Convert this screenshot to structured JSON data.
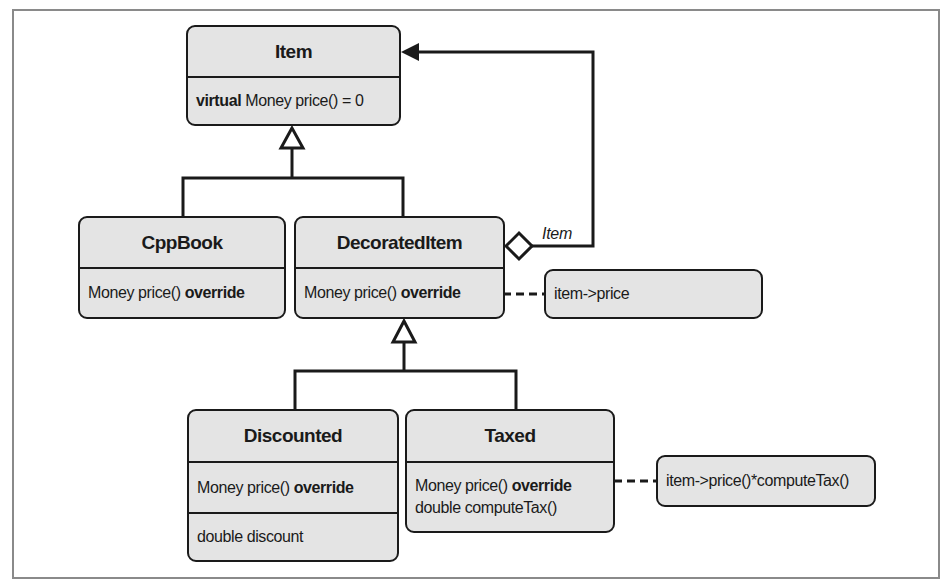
{
  "diagram": {
    "type": "UML class diagram (Decorator pattern)",
    "classes": {
      "item": {
        "name": "Item",
        "methods": [
          {
            "keyword": "virtual",
            "text": " Money price() = 0"
          }
        ]
      },
      "cppbook": {
        "name": "CppBook",
        "methods": [
          {
            "text": "Money price() ",
            "keyword": "override"
          }
        ]
      },
      "decorated_item": {
        "name": "DecoratedItem",
        "methods": [
          {
            "text": "Money price() ",
            "keyword": "override"
          }
        ]
      },
      "discounted": {
        "name": "Discounted",
        "methods": [
          {
            "text": "Money price() ",
            "keyword": "override"
          }
        ],
        "fields": [
          "double discount"
        ]
      },
      "taxed": {
        "name": "Taxed",
        "methods": [
          {
            "text": "Money price() ",
            "keyword": "override"
          },
          {
            "text": "double computeTax()"
          }
        ]
      }
    },
    "notes": {
      "decorated_item_price": "item->price",
      "taxed_price": "item->price()*computeTax()"
    },
    "associations": {
      "decorated_to_item_label": "Item"
    },
    "colors": {
      "box_fill": "#e4e4e4",
      "stroke": "#1a1a1a",
      "frame": "#8a8a8a"
    }
  }
}
